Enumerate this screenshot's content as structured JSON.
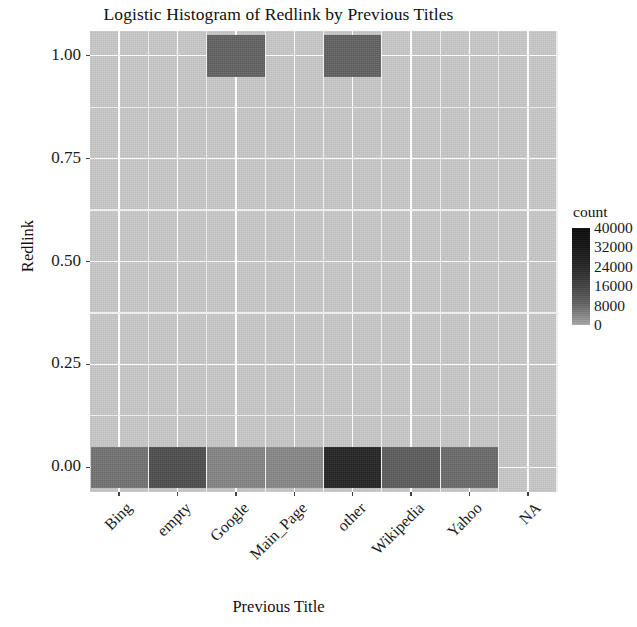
{
  "chart_data": {
    "type": "heatmap",
    "title": "Logistic Histogram of Redlink by Previous Titles",
    "xlabel": "Previous Title",
    "ylabel": "Redlink",
    "categories": [
      "Bing",
      "empty",
      "Google",
      "Main_Page",
      "other",
      "Wikipedia",
      "Yahoo",
      "NA"
    ],
    "x_tick_labels": [
      "Bing",
      "empty",
      "Google",
      "Main_Page",
      "other",
      "Wikipedia",
      "Yahoo",
      "NA"
    ],
    "y_tick_labels": [
      "1.00",
      "0.75",
      "0.50",
      "0.25",
      "0.00"
    ],
    "y_tick_values": [
      1.0,
      0.75,
      0.5,
      0.25,
      0.0
    ],
    "ylim": [
      -0.06,
      1.06
    ],
    "grid": true,
    "legend": {
      "title": "count",
      "position": "right",
      "tick_labels": [
        "40000",
        "32000",
        "24000",
        "16000",
        "8000",
        "0"
      ],
      "tick_values": [
        40000,
        32000,
        24000,
        16000,
        8000,
        0
      ],
      "gradient_low": "#b0b0b0",
      "gradient_high": "#0b0b0b"
    },
    "panel_background": "#c9c9c9",
    "gridline_color": "#fdfdfd",
    "bins": [
      {
        "category": "Bing",
        "redlink": 0.0,
        "count": 9000,
        "fill": "#737373"
      },
      {
        "category": "empty",
        "redlink": 0.0,
        "count": 22000,
        "fill": "#4e4e4e"
      },
      {
        "category": "Google",
        "redlink": 0.0,
        "count": 6000,
        "fill": "#858585"
      },
      {
        "category": "Main_Page",
        "redlink": 0.0,
        "count": 5500,
        "fill": "#898989"
      },
      {
        "category": "other",
        "redlink": 0.0,
        "count": 38000,
        "fill": "#242424"
      },
      {
        "category": "Wikipedia",
        "redlink": 0.0,
        "count": 15000,
        "fill": "#5d5d5d"
      },
      {
        "category": "Yahoo",
        "redlink": 0.0,
        "count": 11000,
        "fill": "#6b6b6b"
      },
      {
        "category": "Google",
        "redlink": 1.0,
        "count": 14000,
        "fill": "#636363"
      },
      {
        "category": "other",
        "redlink": 1.0,
        "count": 14500,
        "fill": "#626262"
      }
    ]
  }
}
